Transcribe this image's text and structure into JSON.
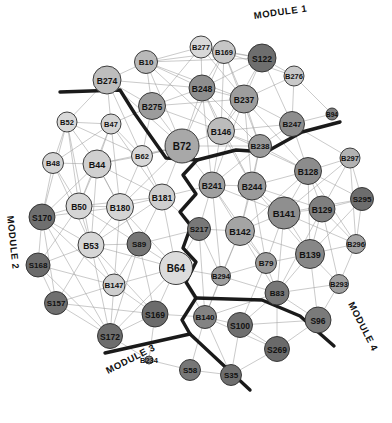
{
  "figure": {
    "type": "network-graph",
    "width": 392,
    "height": 423,
    "background": "#ffffff",
    "edge_color": "#9a9a9a",
    "node_stroke": "#2b2b2b",
    "boundary_color": "#1a1a1a"
  },
  "module_labels": [
    {
      "id": "module-1",
      "text": "MODULE 1",
      "x": 253,
      "y": 10,
      "rotate": -8
    },
    {
      "id": "module-2",
      "text": "MODULE 2",
      "x": 16,
      "y": 215,
      "rotate": 84
    },
    {
      "id": "module-3",
      "text": "MODULE 3",
      "x": 104,
      "y": 366,
      "rotate": -27
    },
    {
      "id": "module-4",
      "text": "MODULE 4",
      "x": 356,
      "y": 300,
      "rotate": 63
    }
  ],
  "legend_note": "",
  "nodes": [
    {
      "id": "B277",
      "label": "B277",
      "x": 201,
      "y": 47,
      "r": 11,
      "fill": "#d8d8d8",
      "fs": 7.5
    },
    {
      "id": "B10",
      "label": "B10",
      "x": 146,
      "y": 62,
      "r": 11.5,
      "fill": "#b9b9b9",
      "fs": 8
    },
    {
      "id": "B169",
      "label": "B169",
      "x": 224,
      "y": 52,
      "r": 11.5,
      "fill": "#c6c6c6",
      "fs": 7.5
    },
    {
      "id": "S122",
      "label": "S122",
      "x": 262,
      "y": 58,
      "r": 14,
      "fill": "#6e6e6e",
      "fs": 8.5
    },
    {
      "id": "B274",
      "label": "B274",
      "x": 107,
      "y": 80,
      "r": 14,
      "fill": "#bdbdbd",
      "fs": 8.5
    },
    {
      "id": "B276",
      "label": "B276",
      "x": 294,
      "y": 76,
      "r": 10,
      "fill": "#c9c9c9",
      "fs": 7.5
    },
    {
      "id": "B275",
      "label": "B275",
      "x": 152,
      "y": 106,
      "r": 13.5,
      "fill": "#9c9c9c",
      "fs": 8.5
    },
    {
      "id": "B248",
      "label": "B248",
      "x": 202,
      "y": 88,
      "r": 13,
      "fill": "#8e8e8e",
      "fs": 8.5
    },
    {
      "id": "B237",
      "label": "B237",
      "x": 244,
      "y": 99,
      "r": 14,
      "fill": "#9d9d9d",
      "fs": 8.5
    },
    {
      "id": "B247",
      "label": "B247",
      "x": 292,
      "y": 124,
      "r": 12.5,
      "fill": "#8d8d8d",
      "fs": 8
    },
    {
      "id": "B94",
      "label": "B94",
      "x": 332,
      "y": 114,
      "r": 6,
      "fill": "#7d7d7d",
      "fs": 6.5
    },
    {
      "id": "B72",
      "label": "B72",
      "x": 182,
      "y": 146,
      "r": 17,
      "fill": "#a8a8a8",
      "fs": 10
    },
    {
      "id": "B146",
      "label": "B146",
      "x": 221,
      "y": 131,
      "r": 13.5,
      "fill": "#bcbcbc",
      "fs": 8.5
    },
    {
      "id": "B238",
      "label": "B238",
      "x": 260,
      "y": 146,
      "r": 11.5,
      "fill": "#9a9a9a",
      "fs": 8
    },
    {
      "id": "B52",
      "label": "B52",
      "x": 67,
      "y": 122,
      "r": 10,
      "fill": "#d9d9d9",
      "fs": 7.5
    },
    {
      "id": "B47",
      "label": "B47",
      "x": 111,
      "y": 124,
      "r": 10,
      "fill": "#d4d4d4",
      "fs": 7.5
    },
    {
      "id": "B48",
      "label": "B48",
      "x": 53,
      "y": 163,
      "r": 10.5,
      "fill": "#d2d2d2",
      "fs": 7.5
    },
    {
      "id": "B44",
      "label": "B44",
      "x": 97,
      "y": 164,
      "r": 14,
      "fill": "#d0d0d0",
      "fs": 9
    },
    {
      "id": "B62",
      "label": "B62",
      "x": 142,
      "y": 156,
      "r": 10.5,
      "fill": "#d8d8d8",
      "fs": 7.5
    },
    {
      "id": "B297",
      "label": "B297",
      "x": 350,
      "y": 158,
      "r": 10,
      "fill": "#b2b2b2",
      "fs": 7.5
    },
    {
      "id": "B128",
      "label": "B128",
      "x": 308,
      "y": 171,
      "r": 13.5,
      "fill": "#8c8c8c",
      "fs": 8.5
    },
    {
      "id": "B181",
      "label": "B181",
      "x": 162,
      "y": 197,
      "r": 13,
      "fill": "#cfcfcf",
      "fs": 8.5
    },
    {
      "id": "B50",
      "label": "B50",
      "x": 79,
      "y": 206,
      "r": 13,
      "fill": "#d5d5d5",
      "fs": 8.5
    },
    {
      "id": "B180",
      "label": "B180",
      "x": 120,
      "y": 207,
      "r": 13.5,
      "fill": "#d4d4d4",
      "fs": 8.5
    },
    {
      "id": "S170",
      "label": "S170",
      "x": 42,
      "y": 217,
      "r": 13,
      "fill": "#6f6f6f",
      "fs": 8.5
    },
    {
      "id": "B241",
      "label": "B241",
      "x": 212,
      "y": 185,
      "r": 13,
      "fill": "#9f9f9f",
      "fs": 8.5
    },
    {
      "id": "B244",
      "label": "B244",
      "x": 252,
      "y": 186,
      "r": 14,
      "fill": "#9a9a9a",
      "fs": 8.5
    },
    {
      "id": "B141",
      "label": "B141",
      "x": 284,
      "y": 213,
      "r": 16,
      "fill": "#8f8f8f",
      "fs": 9.5
    },
    {
      "id": "B129",
      "label": "B129",
      "x": 322,
      "y": 209,
      "r": 13,
      "fill": "#7f7f7f",
      "fs": 8.5
    },
    {
      "id": "S295",
      "label": "S295",
      "x": 362,
      "y": 199,
      "r": 11.5,
      "fill": "#6d6d6d",
      "fs": 8
    },
    {
      "id": "S217",
      "label": "S217",
      "x": 199,
      "y": 229,
      "r": 11.5,
      "fill": "#787878",
      "fs": 8
    },
    {
      "id": "B142",
      "label": "B142",
      "x": 240,
      "y": 231,
      "r": 14.5,
      "fill": "#a4a4a4",
      "fs": 9
    },
    {
      "id": "B139",
      "label": "B139",
      "x": 310,
      "y": 254,
      "r": 14.5,
      "fill": "#878787",
      "fs": 9
    },
    {
      "id": "B296",
      "label": "B296",
      "x": 356,
      "y": 244,
      "r": 9.5,
      "fill": "#a2a2a2",
      "fs": 7.5
    },
    {
      "id": "B79",
      "label": "B79",
      "x": 266,
      "y": 263,
      "r": 10.5,
      "fill": "#9b9b9b",
      "fs": 8
    },
    {
      "id": "B293",
      "label": "B293",
      "x": 339,
      "y": 284,
      "r": 9.5,
      "fill": "#9f9f9f",
      "fs": 7.5
    },
    {
      "id": "B53",
      "label": "B53",
      "x": 91,
      "y": 245,
      "r": 13,
      "fill": "#d6d6d6",
      "fs": 8.5
    },
    {
      "id": "S89",
      "label": "S89",
      "x": 139,
      "y": 244,
      "r": 12,
      "fill": "#757575",
      "fs": 8
    },
    {
      "id": "B64",
      "label": "B64",
      "x": 176,
      "y": 268,
      "r": 16.5,
      "fill": "#dcdcdc",
      "fs": 10
    },
    {
      "id": "S168",
      "label": "S168",
      "x": 38,
      "y": 265,
      "r": 12,
      "fill": "#6b6b6b",
      "fs": 8
    },
    {
      "id": "B147",
      "label": "B147",
      "x": 114,
      "y": 285,
      "r": 11,
      "fill": "#cecece",
      "fs": 8
    },
    {
      "id": "B294",
      "label": "B294",
      "x": 221,
      "y": 276,
      "r": 9.5,
      "fill": "#9e9e9e",
      "fs": 7.5
    },
    {
      "id": "B83",
      "label": "B83",
      "x": 277,
      "y": 293,
      "r": 12,
      "fill": "#777777",
      "fs": 8
    },
    {
      "id": "S157",
      "label": "S157",
      "x": 56,
      "y": 303,
      "r": 11.5,
      "fill": "#6f6f6f",
      "fs": 8
    },
    {
      "id": "S169",
      "label": "S169",
      "x": 155,
      "y": 314,
      "r": 13,
      "fill": "#6c6c6c",
      "fs": 8.5
    },
    {
      "id": "S96",
      "label": "S96",
      "x": 318,
      "y": 320,
      "r": 13,
      "fill": "#7a7a7a",
      "fs": 8.5
    },
    {
      "id": "B140",
      "label": "B140",
      "x": 205,
      "y": 317,
      "r": 11.5,
      "fill": "#838383",
      "fs": 8
    },
    {
      "id": "S100",
      "label": "S100",
      "x": 240,
      "y": 325,
      "r": 12.5,
      "fill": "#6f6f6f",
      "fs": 8.5
    },
    {
      "id": "S172",
      "label": "S172",
      "x": 110,
      "y": 336,
      "r": 12.5,
      "fill": "#6d6d6d",
      "fs": 8.5
    },
    {
      "id": "S269",
      "label": "S269",
      "x": 277,
      "y": 349,
      "r": 12.5,
      "fill": "#6a6a6a",
      "fs": 8.5
    },
    {
      "id": "B234",
      "label": "B234",
      "x": 149,
      "y": 360,
      "r": 4,
      "fill": "#8a8a8a",
      "fs": 7.5
    },
    {
      "id": "S58",
      "label": "S58",
      "x": 190,
      "y": 370,
      "r": 10.5,
      "fill": "#777777",
      "fs": 8
    },
    {
      "id": "S35",
      "label": "S35",
      "x": 231,
      "y": 375,
      "r": 10.5,
      "fill": "#6e6e6e",
      "fs": 8
    }
  ],
  "edges": [
    [
      "B277",
      "B10"
    ],
    [
      "B277",
      "B169"
    ],
    [
      "B277",
      "S122"
    ],
    [
      "B277",
      "B248"
    ],
    [
      "B277",
      "B237"
    ],
    [
      "B277",
      "B275"
    ],
    [
      "B10",
      "B169"
    ],
    [
      "B10",
      "B274"
    ],
    [
      "B10",
      "B275"
    ],
    [
      "B10",
      "B248"
    ],
    [
      "B10",
      "B237"
    ],
    [
      "B10",
      "B72"
    ],
    [
      "B10",
      "S122"
    ],
    [
      "B10",
      "B146"
    ],
    [
      "B169",
      "S122"
    ],
    [
      "B169",
      "B248"
    ],
    [
      "B169",
      "B237"
    ],
    [
      "B169",
      "B276"
    ],
    [
      "B169",
      "B146"
    ],
    [
      "B169",
      "B72"
    ],
    [
      "B169",
      "B238"
    ],
    [
      "S122",
      "B276"
    ],
    [
      "S122",
      "B237"
    ],
    [
      "S122",
      "B247"
    ],
    [
      "S122",
      "B248"
    ],
    [
      "S122",
      "B146"
    ],
    [
      "B274",
      "B275"
    ],
    [
      "B274",
      "B248"
    ],
    [
      "B274",
      "B72"
    ],
    [
      "B274",
      "B47"
    ],
    [
      "B274",
      "B52"
    ],
    [
      "B274",
      "B62"
    ],
    [
      "B276",
      "B247"
    ],
    [
      "B276",
      "B94"
    ],
    [
      "B276",
      "B237"
    ],
    [
      "B275",
      "B248"
    ],
    [
      "B275",
      "B72"
    ],
    [
      "B275",
      "B237"
    ],
    [
      "B275",
      "B146"
    ],
    [
      "B275",
      "B62"
    ],
    [
      "B275",
      "B47"
    ],
    [
      "B248",
      "B237"
    ],
    [
      "B248",
      "B146"
    ],
    [
      "B248",
      "B72"
    ],
    [
      "B248",
      "B238"
    ],
    [
      "B248",
      "B241"
    ],
    [
      "B248",
      "B244"
    ],
    [
      "B237",
      "B146"
    ],
    [
      "B237",
      "B238"
    ],
    [
      "B237",
      "B247"
    ],
    [
      "B237",
      "B244"
    ],
    [
      "B237",
      "B128"
    ],
    [
      "B237",
      "B241"
    ],
    [
      "B247",
      "B238"
    ],
    [
      "B247",
      "B128"
    ],
    [
      "B247",
      "B94"
    ],
    [
      "B247",
      "B297"
    ],
    [
      "B247",
      "B146"
    ],
    [
      "B72",
      "B146"
    ],
    [
      "B72",
      "B62"
    ],
    [
      "B72",
      "B181"
    ],
    [
      "B72",
      "B241"
    ],
    [
      "B72",
      "B238"
    ],
    [
      "B72",
      "B44"
    ],
    [
      "B72",
      "B180"
    ],
    [
      "B146",
      "B238"
    ],
    [
      "B146",
      "B241"
    ],
    [
      "B146",
      "B244"
    ],
    [
      "B146",
      "B128"
    ],
    [
      "B238",
      "B241"
    ],
    [
      "B238",
      "B244"
    ],
    [
      "B238",
      "B128"
    ],
    [
      "B238",
      "B142"
    ],
    [
      "B52",
      "B47"
    ],
    [
      "B52",
      "B48"
    ],
    [
      "B52",
      "B44"
    ],
    [
      "B52",
      "B50"
    ],
    [
      "B52",
      "S170"
    ],
    [
      "B52",
      "B62"
    ],
    [
      "B52",
      "B53"
    ],
    [
      "B47",
      "B44"
    ],
    [
      "B47",
      "B62"
    ],
    [
      "B47",
      "B50"
    ],
    [
      "B47",
      "B180"
    ],
    [
      "B47",
      "B48"
    ],
    [
      "B47",
      "B181"
    ],
    [
      "B48",
      "B44"
    ],
    [
      "B48",
      "B50"
    ],
    [
      "B48",
      "S170"
    ],
    [
      "B48",
      "B53"
    ],
    [
      "B44",
      "B62"
    ],
    [
      "B44",
      "B50"
    ],
    [
      "B44",
      "B180"
    ],
    [
      "B44",
      "B181"
    ],
    [
      "B44",
      "S170"
    ],
    [
      "B44",
      "B53"
    ],
    [
      "B44",
      "S89"
    ],
    [
      "B62",
      "B181"
    ],
    [
      "B62",
      "B180"
    ],
    [
      "B62",
      "B72"
    ],
    [
      "B297",
      "B128"
    ],
    [
      "B297",
      "B129"
    ],
    [
      "B297",
      "S295"
    ],
    [
      "B297",
      "B141"
    ],
    [
      "B297",
      "B296"
    ],
    [
      "B128",
      "B129"
    ],
    [
      "B128",
      "B141"
    ],
    [
      "B128",
      "B244"
    ],
    [
      "B128",
      "S295"
    ],
    [
      "B128",
      "B139"
    ],
    [
      "B128",
      "B142"
    ],
    [
      "B128",
      "B296"
    ],
    [
      "B181",
      "B180"
    ],
    [
      "B181",
      "B50"
    ],
    [
      "B181",
      "S89"
    ],
    [
      "B181",
      "B64"
    ],
    [
      "B181",
      "B53"
    ],
    [
      "B181",
      "S217"
    ],
    [
      "B181",
      "B241"
    ],
    [
      "B50",
      "B180"
    ],
    [
      "B50",
      "S170"
    ],
    [
      "B50",
      "B53"
    ],
    [
      "B50",
      "S89"
    ],
    [
      "B50",
      "S168"
    ],
    [
      "B180",
      "S170"
    ],
    [
      "B180",
      "B53"
    ],
    [
      "B180",
      "S89"
    ],
    [
      "B180",
      "B147"
    ],
    [
      "B180",
      "B64"
    ],
    [
      "S170",
      "S168"
    ],
    [
      "S170",
      "B53"
    ],
    [
      "S170",
      "S157"
    ],
    [
      "S170",
      "B147"
    ],
    [
      "S170",
      "S172"
    ],
    [
      "B241",
      "B244"
    ],
    [
      "B241",
      "B142"
    ],
    [
      "B241",
      "S217"
    ],
    [
      "B241",
      "B141"
    ],
    [
      "B241",
      "B79"
    ],
    [
      "B241",
      "B294"
    ],
    [
      "B244",
      "B141"
    ],
    [
      "B244",
      "B142"
    ],
    [
      "B244",
      "B129"
    ],
    [
      "B244",
      "B139"
    ],
    [
      "B244",
      "B79"
    ],
    [
      "B141",
      "B129"
    ],
    [
      "B141",
      "B139"
    ],
    [
      "B141",
      "B142"
    ],
    [
      "B141",
      "B79"
    ],
    [
      "B141",
      "B83"
    ],
    [
      "B141",
      "S295"
    ],
    [
      "B141",
      "B296"
    ],
    [
      "B129",
      "S295"
    ],
    [
      "B129",
      "B139"
    ],
    [
      "B129",
      "B296"
    ],
    [
      "B129",
      "B293"
    ],
    [
      "B129",
      "B83"
    ],
    [
      "S295",
      "B296"
    ],
    [
      "S295",
      "B139"
    ],
    [
      "S217",
      "B142"
    ],
    [
      "S217",
      "B64"
    ],
    [
      "S217",
      "B294"
    ],
    [
      "S217",
      "B140"
    ],
    [
      "S217",
      "S89"
    ],
    [
      "B142",
      "B79"
    ],
    [
      "B142",
      "B294"
    ],
    [
      "B142",
      "B83"
    ],
    [
      "B142",
      "B140"
    ],
    [
      "B142",
      "B139"
    ],
    [
      "B139",
      "B296"
    ],
    [
      "B139",
      "B293"
    ],
    [
      "B139",
      "B83"
    ],
    [
      "B139",
      "S96"
    ],
    [
      "B139",
      "B79"
    ],
    [
      "B296",
      "B293"
    ],
    [
      "B79",
      "B83"
    ],
    [
      "B79",
      "B294"
    ],
    [
      "B79",
      "S100"
    ],
    [
      "B293",
      "S96"
    ],
    [
      "B293",
      "B83"
    ],
    [
      "B53",
      "S89"
    ],
    [
      "B53",
      "B147"
    ],
    [
      "B53",
      "S168"
    ],
    [
      "B53",
      "S157"
    ],
    [
      "B53",
      "B64"
    ],
    [
      "B53",
      "S169"
    ],
    [
      "B53",
      "S172"
    ],
    [
      "S89",
      "B64"
    ],
    [
      "S89",
      "B147"
    ],
    [
      "S89",
      "S169"
    ],
    [
      "S89",
      "S172"
    ],
    [
      "B64",
      "B147"
    ],
    [
      "B64",
      "S169"
    ],
    [
      "B64",
      "B140"
    ],
    [
      "B64",
      "B294"
    ],
    [
      "B64",
      "S172"
    ],
    [
      "S168",
      "S157"
    ],
    [
      "S168",
      "B147"
    ],
    [
      "S168",
      "S172"
    ],
    [
      "B147",
      "S157"
    ],
    [
      "B147",
      "S169"
    ],
    [
      "B147",
      "S172"
    ],
    [
      "B294",
      "B140"
    ],
    [
      "B294",
      "B83"
    ],
    [
      "B83",
      "S96"
    ],
    [
      "B83",
      "S100"
    ],
    [
      "B83",
      "S269"
    ],
    [
      "B83",
      "B140"
    ],
    [
      "S157",
      "S172"
    ],
    [
      "S157",
      "S169"
    ],
    [
      "S169",
      "S172"
    ],
    [
      "S169",
      "B140"
    ],
    [
      "S169",
      "B234"
    ],
    [
      "S96",
      "S269"
    ],
    [
      "S96",
      "S100"
    ],
    [
      "B140",
      "S100"
    ],
    [
      "B140",
      "S269"
    ],
    [
      "B140",
      "S58"
    ],
    [
      "B140",
      "S35"
    ],
    [
      "S100",
      "S269"
    ],
    [
      "S100",
      "S35"
    ],
    [
      "S172",
      "B234"
    ],
    [
      "S269",
      "S35"
    ],
    [
      "S58",
      "S35"
    ],
    [
      "S58",
      "B234"
    ]
  ],
  "boundaries": [
    {
      "id": "boundary-1-2",
      "points": "60,92 120,90 135,114 166,158 197,160"
    },
    {
      "id": "boundary-1-right",
      "points": "197,160 236,150 266,152 302,132 340,122"
    },
    {
      "id": "boundary-2-3",
      "points": "197,160 183,175 196,194 180,212 191,226 183,248 196,262 186,282 196,298 182,320 190,334"
    },
    {
      "id": "boundary-3-left",
      "points": "190,334 105,353"
    },
    {
      "id": "boundary-3-right",
      "points": "190,334 250,390"
    },
    {
      "id": "boundary-4",
      "points": "196,298 262,300 300,316 334,346"
    }
  ]
}
